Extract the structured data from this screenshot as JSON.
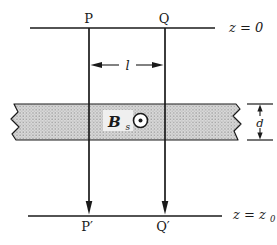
{
  "figure": {
    "labels": {
      "z_top": "z = 0",
      "p_top": "P",
      "q_top": "Q",
      "separation": "l",
      "field_base": "B",
      "field_sub": "s",
      "thickness": "d",
      "z_bottom_base": "z = z",
      "z_bottom_sub": "0",
      "p_bottom": "P′",
      "q_bottom": "Q′"
    },
    "icons": {
      "field_direction": "field-out-of-page-icon"
    },
    "colors": {
      "line": "#1a1a1a",
      "slab_fill": "#d9d9d9",
      "slab_dot": "#878787",
      "background": "#ffffff"
    }
  }
}
